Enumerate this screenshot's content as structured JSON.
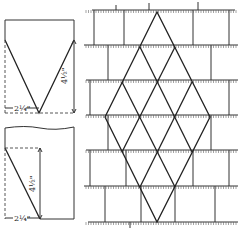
{
  "figure": {
    "type": "technical drawing"
  },
  "template_top": {
    "width_label": "2¼\"",
    "height_label": "4½\"",
    "shape": "pointed (V-cut) shingle"
  },
  "template_bottom": {
    "width_label": "2¼\"",
    "height_label": "4½\"",
    "shape": "single-bevel (half) shingle"
  },
  "pattern": {
    "description": "Diamond pattern laid within courses of rectangular shingles",
    "courses_y": [
      10,
      45,
      80,
      115,
      150,
      186,
      222
    ],
    "diamond_apex_top": [
      157,
      12
    ],
    "diamond_apex_bottom": [
      157,
      222
    ]
  }
}
